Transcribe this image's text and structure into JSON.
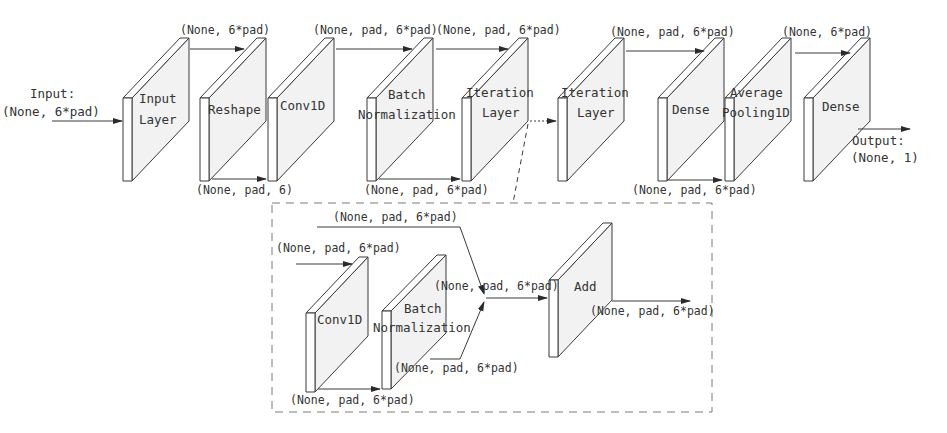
{
  "diagram": {
    "title": "",
    "input": {
      "label": "Input:",
      "shape": "(None, 6*pad)"
    },
    "output": {
      "label": "Output:",
      "shape": "(None, 1)"
    },
    "main_layers": [
      {
        "id": "input-layer",
        "lines": [
          "Input",
          "Layer"
        ]
      },
      {
        "id": "reshape",
        "lines": [
          "Reshape"
        ]
      },
      {
        "id": "conv1d",
        "lines": [
          "Conv1D"
        ]
      },
      {
        "id": "batch-normalization",
        "lines": [
          "Batch",
          "Normalization"
        ]
      },
      {
        "id": "iteration-layer-1",
        "lines": [
          "Iteration",
          "Layer"
        ]
      },
      {
        "id": "iteration-layer-2",
        "lines": [
          "Iteration",
          "Layer"
        ]
      },
      {
        "id": "dense-1",
        "lines": [
          "Dense"
        ]
      },
      {
        "id": "average-pooling1d",
        "lines": [
          "Average",
          "Pooling1D"
        ]
      },
      {
        "id": "dense-2",
        "lines": [
          "Dense"
        ]
      }
    ],
    "main_edges": [
      {
        "from": "input-layer",
        "to": "reshape",
        "shape": "(None, 6*pad)",
        "position": "top"
      },
      {
        "from": "reshape",
        "to": "conv1d",
        "shape": "(None, pad, 6)",
        "position": "bottom"
      },
      {
        "from": "conv1d",
        "to": "batch-normalization",
        "shape": "(None, pad, 6*pad)",
        "position": "top"
      },
      {
        "from": "batch-normalization",
        "to": "iteration-layer-1",
        "shape": "(None, pad, 6*pad)",
        "position": "bottom"
      },
      {
        "from": "iteration-layer-1",
        "to": "iteration-layer-2",
        "shape": "(None, pad, 6*pad)",
        "position": "top",
        "style": "dotted"
      },
      {
        "from": "iteration-layer-2",
        "to": "dense-1",
        "shape": "(None, pad, 6*pad)",
        "position": "top"
      },
      {
        "from": "dense-1",
        "to": "average-pooling1d",
        "shape": "(None, pad, 6*pad)",
        "position": "bottom"
      },
      {
        "from": "average-pooling1d",
        "to": "dense-2",
        "shape": "(None, 6*pad)",
        "position": "top"
      }
    ],
    "iteration_detail": {
      "layers": [
        {
          "id": "inner-conv1d",
          "lines": [
            "Conv1D"
          ]
        },
        {
          "id": "inner-batch-normalization",
          "lines": [
            "Batch",
            "Normalization"
          ]
        },
        {
          "id": "add",
          "lines": [
            "Add"
          ]
        }
      ],
      "shapes": {
        "input": "(None, pad, 6*pad)",
        "skip": "(None, pad, 6*pad)",
        "conv_to_bn": "(None, pad, 6*pad)",
        "bn_out": "(None, pad, 6*pad)",
        "merge": "(None, pad, 6*pad)",
        "output": "(None, pad, 6*pad)"
      }
    }
  }
}
